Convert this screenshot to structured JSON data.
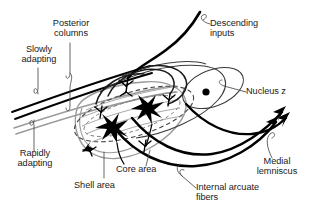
{
  "figure": {
    "background_color": "#ffffff",
    "ink_color": "#000000",
    "secondary_ink_color": "#9a9a9a",
    "text_color": "#1a1a1a",
    "width": 311,
    "height": 221
  },
  "labels": {
    "posterior_columns": "Posterior\ncolumns",
    "slowly_adapting": "Slowly\nadapting",
    "rapidly_adapting": "Rapidly\nadapting",
    "descending_inputs": "Descending\ninputs",
    "nucleus_z": "Nucleus z",
    "core_area": "Core area",
    "shell_area": "Shell area",
    "internal_arcuate_fibers": "Internal arcuate\nfibers",
    "medial_lemniscus": "Medial\nlemniscus"
  },
  "structures": {
    "shell_area_name": "shell-area-outline",
    "core_area_name": "core-area-outline",
    "neuron_count": 2,
    "nucleus_z_marker": "filled-dot",
    "medial_lemniscus_arrow_count": 3,
    "slowly_adapting_tract_color": "#000000",
    "rapidly_adapting_tract_color": "#9a9a9a"
  }
}
